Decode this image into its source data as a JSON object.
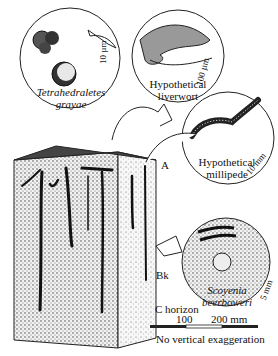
{
  "figure": {
    "insets": {
      "spore": {
        "name_line1": "Tetrahedraletes",
        "name_line2": "grayae",
        "scale": "10 µm"
      },
      "liverwort": {
        "name_line1": "Hypothetical",
        "name_line2": "liverwort",
        "scale": "100 µm"
      },
      "millipede": {
        "name_line1": "Hypothetical",
        "name_line2": "millipede",
        "scale": "10 mm"
      },
      "burrow": {
        "name_line1": "Scoyenia",
        "name_line2": "beerboweri",
        "scale": "5 mm"
      }
    },
    "horizons": {
      "a": "A",
      "bk": "Bk",
      "c": "C horizon"
    },
    "scale_bar": {
      "tick_100": "100",
      "tick_200": "200 mm",
      "note": "No vertical exaggeration"
    }
  }
}
